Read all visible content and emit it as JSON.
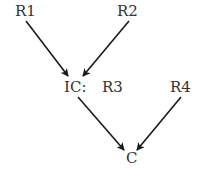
{
  "diagram": {
    "nodes": [
      {
        "id": "R1",
        "label": "R1"
      },
      {
        "id": "R2",
        "label": "R2"
      },
      {
        "id": "IC",
        "label": "IC:"
      },
      {
        "id": "R3",
        "label": "R3"
      },
      {
        "id": "R4",
        "label": "R4"
      },
      {
        "id": "C",
        "label": "C"
      }
    ],
    "edges": [
      {
        "from": "R1",
        "to": "IC"
      },
      {
        "from": "R2",
        "to": "IC"
      },
      {
        "from": "IC",
        "to": "C"
      },
      {
        "from": "R4",
        "to": "C"
      }
    ],
    "colors": {
      "text": "#333333",
      "arrow": "#1a1a1a",
      "background": "#ffffff"
    }
  }
}
